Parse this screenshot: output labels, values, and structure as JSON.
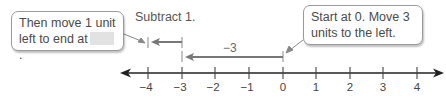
{
  "callouts": {
    "left": {
      "line1": "Then move 1 unit",
      "line2": "left to end at",
      "blank": "",
      "end": "."
    },
    "right": {
      "line1": "Start at 0. Move 3",
      "line2": "units to the left."
    }
  },
  "labels": {
    "subtract": "Subtract 1.",
    "minus_three": "−3"
  },
  "number_line": {
    "min": -4,
    "max": 4,
    "ticks": [
      "−4",
      "−3",
      "−2",
      "−1",
      "0",
      "1",
      "2",
      "3",
      "4"
    ]
  },
  "colors": {
    "axis": "#222222",
    "arrow": "#7a7a7a",
    "callout_border": "#9a9a9a",
    "blank_fill": "#e2e2e2"
  }
}
